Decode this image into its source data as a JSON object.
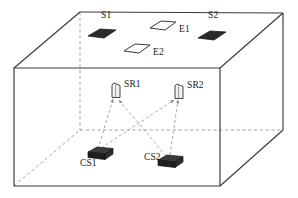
{
  "figure": {
    "kind": "3d-room-layout-diagram",
    "width": 298,
    "height": 198,
    "background_color": "#ffffff",
    "line_color": "#3a3a3a",
    "dashed_color": "#8c8c8c",
    "fill_dark": "#2b2b2b",
    "fill_light": "#ffffff"
  },
  "room": {
    "description": "Wireframe rectangular room drawn in oblique projection",
    "front_face": {
      "top_left": [
        14,
        68
      ],
      "top_right": [
        220,
        68
      ],
      "bottom_right": [
        220,
        186
      ],
      "bottom_left": [
        14,
        186
      ]
    },
    "back_face": {
      "top_left": [
        80,
        12
      ],
      "top_right": [
        283,
        13
      ],
      "bottom_right": [
        283,
        130
      ],
      "bottom_left": [
        80,
        130
      ]
    }
  },
  "ceiling_objects": [
    {
      "id": "S1",
      "label": "S1",
      "shape": "parallelogram",
      "fill": "dark",
      "x": 88,
      "y": 31,
      "w": 28,
      "h": 11,
      "label_x": 101,
      "label_y": 16
    },
    {
      "id": "E1",
      "label": "E1",
      "shape": "parallelogram",
      "fill": "light",
      "x": 150,
      "y": 22,
      "w": 25,
      "h": 10,
      "label_x": 179,
      "label_y": 30
    },
    {
      "id": "S2",
      "label": "S2",
      "shape": "parallelogram",
      "fill": "dark",
      "x": 198,
      "y": 32,
      "w": 28,
      "h": 11,
      "label_x": 208,
      "label_y": 16
    },
    {
      "id": "E2",
      "label": "E2",
      "shape": "parallelogram",
      "fill": "light",
      "x": 124,
      "y": 45,
      "w": 25,
      "h": 10,
      "label_x": 154,
      "label_y": 53
    }
  ],
  "receivers": [
    {
      "id": "SR1",
      "label": "SR1",
      "x": 114,
      "y": 86,
      "label_x": 127,
      "label_y": 83
    },
    {
      "id": "SR2",
      "label": "SR2",
      "x": 177,
      "y": 87,
      "label_x": 190,
      "label_y": 84
    }
  ],
  "sources": [
    {
      "id": "CS1",
      "label": "CS1",
      "x": 94,
      "y": 150,
      "label_x": 82,
      "label_y": 166
    },
    {
      "id": "CS2",
      "label": "CS2",
      "x": 164,
      "y": 158,
      "label_x": 146,
      "label_y": 159
    }
  ],
  "signal_paths": [
    {
      "from": "CS1",
      "to": "SR1",
      "style": "dashed-arrow"
    },
    {
      "from": "CS1",
      "to": "SR2",
      "style": "dashed-arrow"
    },
    {
      "from": "CS2",
      "to": "SR1",
      "style": "dashed-arrow"
    },
    {
      "from": "CS2",
      "to": "SR2",
      "style": "dashed-arrow"
    }
  ],
  "labels": {
    "s1": "S1",
    "e1": "E1",
    "s2": "S2",
    "e2": "E2",
    "sr1": "SR1",
    "sr2": "SR2",
    "cs1": "CS1",
    "cs2": "CS2"
  }
}
